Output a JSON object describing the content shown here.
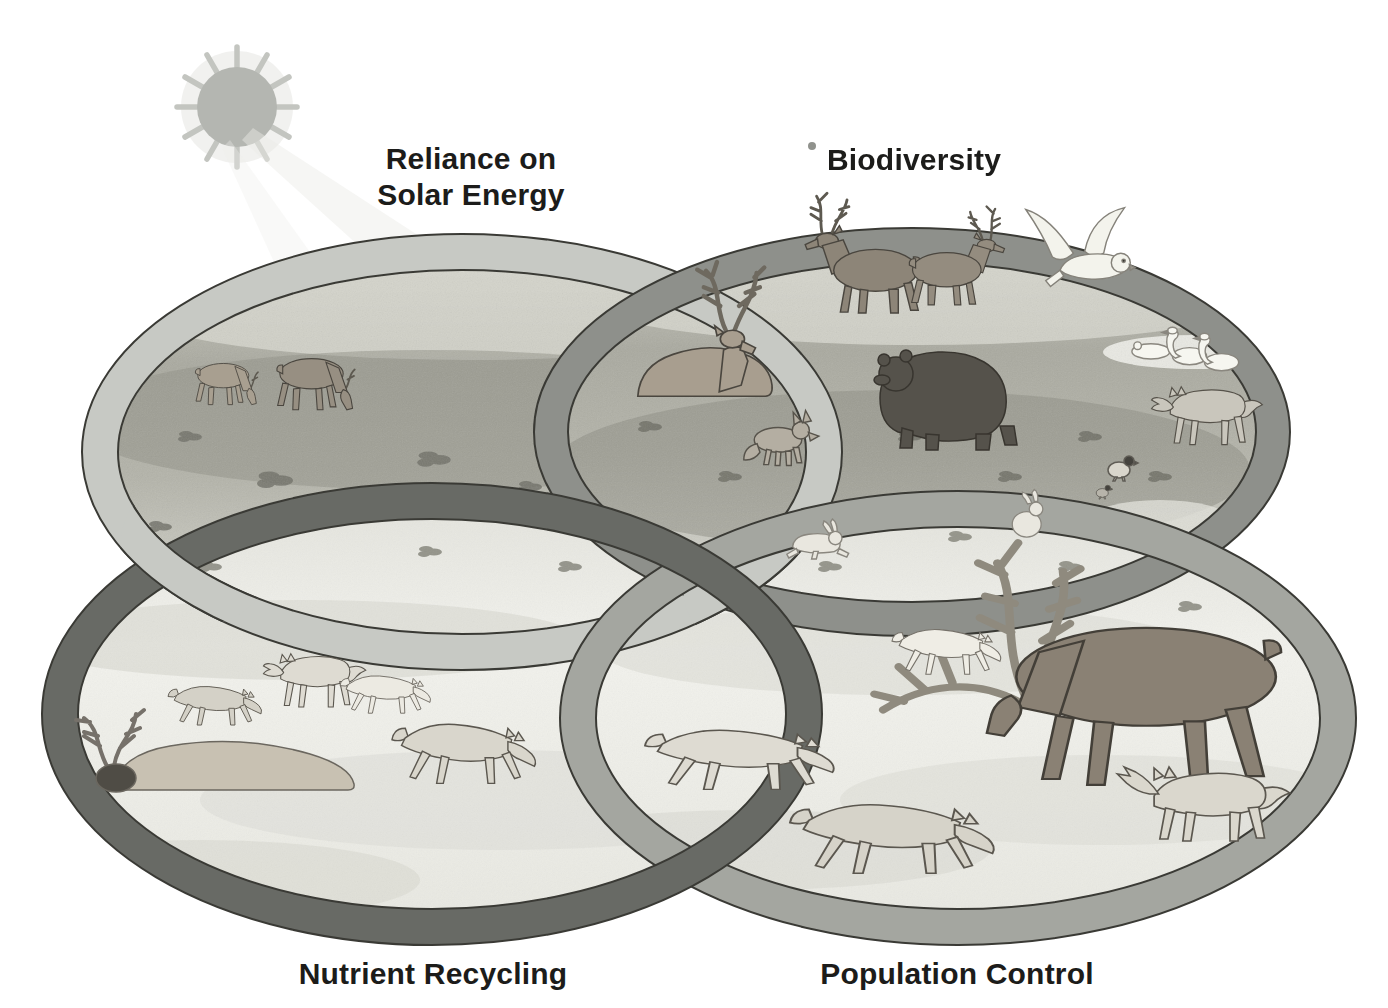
{
  "diagram": {
    "labels": {
      "reliance_line1": "Reliance on",
      "reliance_line2": "Solar Energy",
      "biodiversity": "Biodiversity",
      "nutrient_recycling": "Nutrient Recycling",
      "population_control": "Population Control"
    },
    "scenes": {
      "reliance_on_solar_energy": {
        "animals": [
          "caribou grazing on tundra",
          "caribou calf grazing"
        ],
        "setting": "sunlit tundra"
      },
      "biodiversity": {
        "animals": [
          "caribou herd",
          "snowy owl in flight",
          "grizzly bear",
          "tundra swans on pond",
          "gray wolf",
          "ptarmigan with chick"
        ],
        "setting": "tundra with pond"
      },
      "nutrient_recycling": {
        "animals": [
          "wolf pack feeding",
          "caribou carcass with antlers"
        ],
        "setting": "snow"
      },
      "population_control": {
        "animals": [
          "wolves hunting",
          "bull caribou defending with antlers",
          "white wolf at antlers"
        ],
        "setting": "snow"
      },
      "overlap_center": {
        "animals": [
          "resting caribou with large antlers",
          "arctic fox",
          "running arctic hare",
          "sitting arctic hare"
        ],
        "setting": "snow patches"
      }
    },
    "colors": {
      "background": "#ffffff",
      "text": "#1c1c1a",
      "sun": "#b4b6b1",
      "sun_ray": "#c3c5c0",
      "ring_outline": "#3a3a35",
      "ring_reliance": "#c7c9c4",
      "ring_biodiversity": "#8e908b",
      "ring_nutrient": "#686a65",
      "ring_population": "#a4a6a0",
      "tundra_mid": "#a8a89e",
      "snow": "#f1f1ec",
      "bear": "#55524b",
      "caribou": "#978f82",
      "wolf": "#dedbd2",
      "carcass": "#c8c1b2"
    }
  }
}
